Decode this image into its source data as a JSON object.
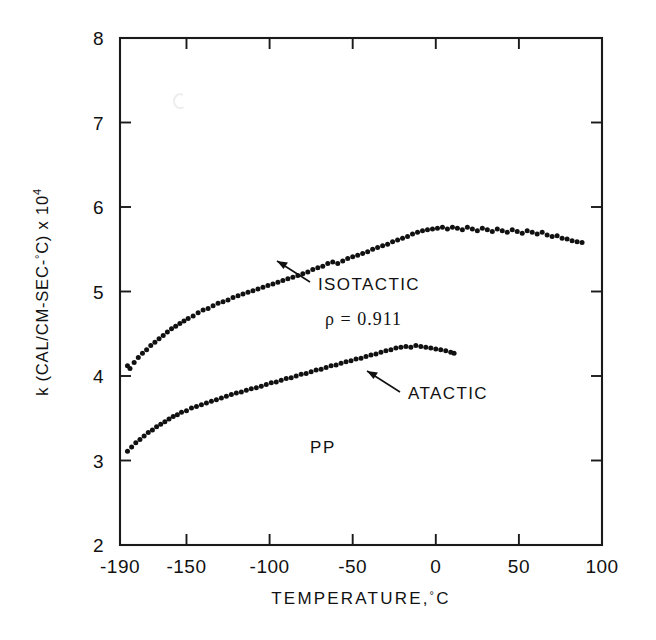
{
  "figure": {
    "background_color": "#ffffff",
    "ink_color": "#111111"
  },
  "axes": {
    "x": {
      "title": "TEMPERATURE,",
      "title_unit_degree": "°",
      "title_unit_letter": "C",
      "min": -190,
      "max": 100,
      "ticks": [
        -190,
        -150,
        -100,
        -50,
        0,
        50,
        100
      ],
      "tick_labels": [
        "-190",
        "-150",
        "-100",
        "-50",
        "0",
        "50",
        "100"
      ]
    },
    "y": {
      "title_main": "k (CAL/CM-SEC-",
      "title_degree": "°",
      "title_close": "C) x 10",
      "title_exponent": "4",
      "min": 2,
      "max": 8,
      "ticks": [
        2,
        3,
        4,
        5,
        6,
        7,
        8
      ],
      "tick_labels": [
        "2",
        "3",
        "4",
        "5",
        "6",
        "7",
        "8"
      ]
    }
  },
  "annotations": {
    "isotactic_label": "ISOTACTIC",
    "density_label": "ρ = 0.911",
    "atactic_label": "ATACTIC",
    "material_label": "PP"
  },
  "chart_data": {
    "type": "scatter",
    "title": "",
    "subtitle": "",
    "xlabel": "TEMPERATURE, °C",
    "ylabel": "k (CAL/CM-SEC-°C) x 10^4",
    "xlim": [
      -190,
      100
    ],
    "ylim": [
      2,
      8
    ],
    "xticks": [
      -190,
      -150,
      -100,
      -50,
      0,
      50,
      100
    ],
    "yticks": [
      2,
      3,
      4,
      5,
      6,
      7,
      8
    ],
    "grid": false,
    "legend_position": "none",
    "marker": "filled-circle",
    "marker_color": "#111111",
    "annotations": [
      {
        "text": "ISOTACTIC",
        "x": -30,
        "y": 5.2,
        "arrow_to_x": -62,
        "arrow_to_y": 5.42
      },
      {
        "text": "ρ = 0.911",
        "x": -28,
        "y": 4.82
      },
      {
        "text": "ATACTIC",
        "x": -22,
        "y": 3.98,
        "arrow_to_x": -52,
        "arrow_to_y": 4.2
      },
      {
        "text": "PP",
        "x": -62,
        "y": 3.42
      }
    ],
    "series": [
      {
        "name": "ISOTACTIC",
        "density": 0.911,
        "points": [
          [
            -185.5,
            4.12
          ],
          [
            -184.0,
            4.09
          ],
          [
            -181.5,
            4.16
          ],
          [
            -179.0,
            4.22
          ],
          [
            -176.5,
            4.27
          ],
          [
            -174.0,
            4.31
          ],
          [
            -171.5,
            4.36
          ],
          [
            -169.0,
            4.4
          ],
          [
            -166.5,
            4.44
          ],
          [
            -164.0,
            4.48
          ],
          [
            -161.5,
            4.52
          ],
          [
            -159.0,
            4.56
          ],
          [
            -156.5,
            4.59
          ],
          [
            -154.0,
            4.62
          ],
          [
            -151.5,
            4.65
          ],
          [
            -149.0,
            4.68
          ],
          [
            -146.0,
            4.71
          ],
          [
            -143.0,
            4.75
          ],
          [
            -140.0,
            4.78
          ],
          [
            -137.0,
            4.8
          ],
          [
            -134.0,
            4.83
          ],
          [
            -131.0,
            4.86
          ],
          [
            -128.0,
            4.88
          ],
          [
            -125.0,
            4.9
          ],
          [
            -122.0,
            4.93
          ],
          [
            -119.0,
            4.95
          ],
          [
            -116.0,
            4.97
          ],
          [
            -113.0,
            4.99
          ],
          [
            -110.0,
            5.01
          ],
          [
            -107.0,
            5.03
          ],
          [
            -104.0,
            5.05
          ],
          [
            -101.0,
            5.07
          ],
          [
            -98.0,
            5.09
          ],
          [
            -95.0,
            5.11
          ],
          [
            -92.0,
            5.13
          ],
          [
            -89.0,
            5.15
          ],
          [
            -86.0,
            5.17
          ],
          [
            -83.0,
            5.19
          ],
          [
            -80.0,
            5.21
          ],
          [
            -77.0,
            5.23
          ],
          [
            -74.0,
            5.26
          ],
          [
            -71.0,
            5.28
          ],
          [
            -68.0,
            5.3
          ],
          [
            -65.0,
            5.33
          ],
          [
            -62.0,
            5.35
          ],
          [
            -59.0,
            5.33
          ],
          [
            -56.0,
            5.36
          ],
          [
            -53.0,
            5.39
          ],
          [
            -50.0,
            5.41
          ],
          [
            -47.0,
            5.43
          ],
          [
            -44.0,
            5.45
          ],
          [
            -41.0,
            5.47
          ],
          [
            -38.0,
            5.5
          ],
          [
            -35.0,
            5.52
          ],
          [
            -32.0,
            5.54
          ],
          [
            -29.0,
            5.56
          ],
          [
            -26.0,
            5.59
          ],
          [
            -23.0,
            5.61
          ],
          [
            -20.0,
            5.63
          ],
          [
            -17.0,
            5.65
          ],
          [
            -14.0,
            5.68
          ],
          [
            -11.0,
            5.7
          ],
          [
            -8.0,
            5.72
          ],
          [
            -5.0,
            5.73
          ],
          [
            -2.0,
            5.74
          ],
          [
            1.0,
            5.75
          ],
          [
            4.0,
            5.76
          ],
          [
            7.0,
            5.74
          ],
          [
            10.0,
            5.76
          ],
          [
            13.0,
            5.75
          ],
          [
            16.0,
            5.73
          ],
          [
            19.0,
            5.76
          ],
          [
            22.0,
            5.74
          ],
          [
            25.0,
            5.72
          ],
          [
            28.0,
            5.75
          ],
          [
            31.0,
            5.73
          ],
          [
            34.0,
            5.71
          ],
          [
            37.0,
            5.74
          ],
          [
            40.0,
            5.72
          ],
          [
            43.0,
            5.7
          ],
          [
            46.0,
            5.73
          ],
          [
            49.0,
            5.71
          ],
          [
            52.0,
            5.69
          ],
          [
            55.0,
            5.72
          ],
          [
            58.0,
            5.7
          ],
          [
            61.0,
            5.68
          ],
          [
            64.0,
            5.7
          ],
          [
            67.0,
            5.67
          ],
          [
            70.0,
            5.65
          ],
          [
            73.0,
            5.66
          ],
          [
            76.0,
            5.63
          ],
          [
            79.0,
            5.62
          ],
          [
            82.0,
            5.6
          ],
          [
            85.0,
            5.59
          ],
          [
            88.0,
            5.58
          ]
        ]
      },
      {
        "name": "ATACTIC",
        "points": [
          [
            -185.5,
            3.11
          ],
          [
            -183.0,
            3.16
          ],
          [
            -180.5,
            3.21
          ],
          [
            -178.0,
            3.25
          ],
          [
            -175.5,
            3.29
          ],
          [
            -173.0,
            3.33
          ],
          [
            -170.5,
            3.36
          ],
          [
            -168.0,
            3.4
          ],
          [
            -165.5,
            3.43
          ],
          [
            -163.0,
            3.46
          ],
          [
            -160.5,
            3.49
          ],
          [
            -158.0,
            3.52
          ],
          [
            -155.5,
            3.54
          ],
          [
            -153.0,
            3.57
          ],
          [
            -150.0,
            3.59
          ],
          [
            -147.0,
            3.62
          ],
          [
            -144.0,
            3.64
          ],
          [
            -141.0,
            3.66
          ],
          [
            -138.0,
            3.68
          ],
          [
            -135.0,
            3.7
          ],
          [
            -132.0,
            3.72
          ],
          [
            -129.0,
            3.74
          ],
          [
            -126.0,
            3.76
          ],
          [
            -123.0,
            3.78
          ],
          [
            -120.0,
            3.8
          ],
          [
            -117.0,
            3.81
          ],
          [
            -114.0,
            3.83
          ],
          [
            -111.0,
            3.85
          ],
          [
            -108.0,
            3.86
          ],
          [
            -105.0,
            3.88
          ],
          [
            -102.0,
            3.9
          ],
          [
            -99.0,
            3.92
          ],
          [
            -96.0,
            3.93
          ],
          [
            -93.0,
            3.95
          ],
          [
            -90.0,
            3.97
          ],
          [
            -87.0,
            3.98
          ],
          [
            -84.0,
            4.0
          ],
          [
            -81.0,
            4.02
          ],
          [
            -78.0,
            4.03
          ],
          [
            -75.0,
            4.05
          ],
          [
            -72.0,
            4.07
          ],
          [
            -69.0,
            4.08
          ],
          [
            -66.0,
            4.1
          ],
          [
            -63.0,
            4.12
          ],
          [
            -60.0,
            4.13
          ],
          [
            -57.0,
            4.15
          ],
          [
            -54.0,
            4.17
          ],
          [
            -51.0,
            4.18
          ],
          [
            -48.0,
            4.2
          ],
          [
            -45.0,
            4.21
          ],
          [
            -42.0,
            4.23
          ],
          [
            -39.0,
            4.25
          ],
          [
            -36.0,
            4.26
          ],
          [
            -33.0,
            4.28
          ],
          [
            -30.0,
            4.3
          ],
          [
            -27.0,
            4.31
          ],
          [
            -24.0,
            4.33
          ],
          [
            -21.0,
            4.34
          ],
          [
            -18.0,
            4.35
          ],
          [
            -15.0,
            4.34
          ],
          [
            -12.0,
            4.36
          ],
          [
            -9.0,
            4.35
          ],
          [
            -6.0,
            4.34
          ],
          [
            -3.0,
            4.33
          ],
          [
            0.0,
            4.32
          ],
          [
            3.0,
            4.31
          ],
          [
            6.0,
            4.3
          ],
          [
            9.0,
            4.28
          ],
          [
            11.0,
            4.27
          ]
        ]
      }
    ]
  }
}
